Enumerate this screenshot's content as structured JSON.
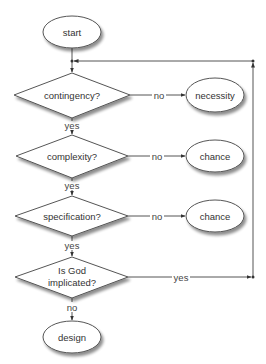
{
  "diagram": {
    "type": "flowchart",
    "colors": {
      "stroke": "#555555",
      "fill": "#ffffff",
      "shadow": "#9a9a9a",
      "text": "#333333"
    },
    "nodes": {
      "start": {
        "label": "start",
        "shape": "ellipse"
      },
      "contingency": {
        "label": "contingency?",
        "shape": "diamond"
      },
      "necessity": {
        "label": "necessity",
        "shape": "ellipse"
      },
      "complexity": {
        "label": "complexity?",
        "shape": "diamond"
      },
      "chance1": {
        "label": "chance",
        "shape": "ellipse"
      },
      "specification": {
        "label": "specification?",
        "shape": "diamond"
      },
      "chance2": {
        "label": "chance",
        "shape": "ellipse"
      },
      "god": {
        "label_line1": "Is God",
        "label_line2": "implicated?",
        "shape": "diamond"
      },
      "design": {
        "label": "design",
        "shape": "ellipse"
      }
    },
    "edges": {
      "contingency_no": "no",
      "contingency_yes": "yes",
      "complexity_no": "no",
      "complexity_yes": "yes",
      "specification_no": "no",
      "specification_yes": "yes",
      "god_yes": "yes",
      "god_no": "no"
    }
  }
}
